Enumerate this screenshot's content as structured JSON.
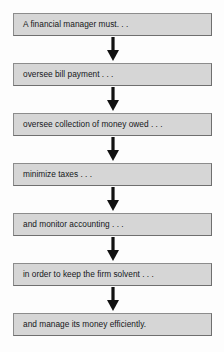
{
  "diagram": {
    "title": "A financial manager must. . .",
    "type": "vertical-flowchart",
    "colors": {
      "box_fill": "#d6d6d6",
      "box_border": "#8c8c8c",
      "text": "#15171a",
      "arrow": "#111111",
      "background": "#fdfdfd"
    },
    "nodes": [
      {
        "label": "A financial manager must. . ."
      },
      {
        "label": "oversee bill payment . . ."
      },
      {
        "label": "oversee collection of money owed . . ."
      },
      {
        "label": "minimize taxes . . ."
      },
      {
        "label": "and monitor accounting . . ."
      },
      {
        "label": "in order to keep the firm solvent . . ."
      },
      {
        "label": "and manage its money efficiently."
      }
    ],
    "connectors": [
      {
        "name": "arrow-down-1",
        "direction": "down"
      },
      {
        "name": "arrow-down-2",
        "direction": "down"
      },
      {
        "name": "arrow-down-3",
        "direction": "down"
      },
      {
        "name": "arrow-down-4",
        "direction": "down"
      },
      {
        "name": "arrow-down-5",
        "direction": "down"
      },
      {
        "name": "arrow-down-6",
        "direction": "down"
      }
    ]
  }
}
